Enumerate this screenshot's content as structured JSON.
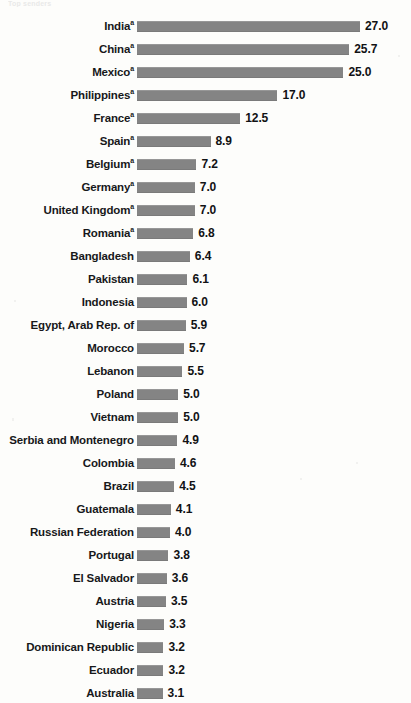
{
  "top_caption_fragment": "Top senders",
  "colors": {
    "bar": "#848484",
    "label_text": "#17181a",
    "value_text": "#111214",
    "background": "#fdfdfb"
  },
  "chart_data": {
    "type": "bar",
    "orientation": "horizontal",
    "title": "",
    "subtitle": "",
    "xlabel": "",
    "ylabel": "",
    "grid": false,
    "legend": null,
    "axis_visible": false,
    "value_label_format": "one-decimal",
    "xlim": [
      0,
      27.0
    ],
    "footnote_marker": "a",
    "categories": [
      "India",
      "China",
      "Mexico",
      "Philippines",
      "France",
      "Spain",
      "Belgium",
      "Germany",
      "United Kingdom",
      "Romania",
      "Bangladesh",
      "Pakistan",
      "Indonesia",
      "Egypt, Arab Rep. of",
      "Morocco",
      "Lebanon",
      "Poland",
      "Vietnam",
      "Serbia and Montenegro",
      "Colombia",
      "Brazil",
      "Guatemala",
      "Russian Federation",
      "Portugal",
      "El Salvador",
      "Austria",
      "Nigeria",
      "Dominican Republic",
      "Ecuador",
      "Australia"
    ],
    "values": [
      27.0,
      25.7,
      25.0,
      17.0,
      12.5,
      8.9,
      7.2,
      7.0,
      7.0,
      6.8,
      6.4,
      6.1,
      6.0,
      5.9,
      5.7,
      5.5,
      5.0,
      5.0,
      4.9,
      4.6,
      4.5,
      4.1,
      4.0,
      3.8,
      3.6,
      3.5,
      3.3,
      3.2,
      3.2,
      3.1
    ],
    "value_labels": [
      "27.0",
      "25.7",
      "25.0",
      "17.0",
      "12.5",
      "8.9",
      "7.2",
      "7.0",
      "7.0",
      "6.8",
      "6.4",
      "6.1",
      "6.0",
      "5.9",
      "5.7",
      "5.5",
      "5.0",
      "5.0",
      "4.9",
      "4.6",
      "4.5",
      "4.1",
      "4.0",
      "3.8",
      "3.6",
      "3.5",
      "3.3",
      "3.2",
      "3.2",
      "3.1"
    ],
    "categories_with_footnote": [
      "India",
      "China",
      "Mexico",
      "Philippines",
      "France",
      "Spain",
      "Belgium",
      "Germany",
      "United Kingdom",
      "Romania"
    ]
  }
}
